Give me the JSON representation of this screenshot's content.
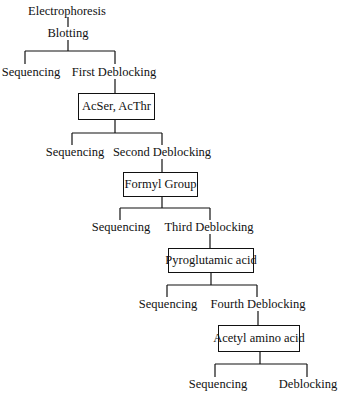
{
  "diagram": {
    "root": "Electrophoresis",
    "step": "Blotting",
    "levels": [
      {
        "left": "Sequencing",
        "right": "First Deblocking",
        "box": "AcSer, AcThr"
      },
      {
        "left": "Sequencing",
        "right": "Second Deblocking",
        "box": "Formyl Group"
      },
      {
        "left": "Sequencing",
        "right": "Third Deblocking",
        "box": "Pyroglutamic acid"
      },
      {
        "left": "Sequencing",
        "right": "Fourth Deblocking",
        "box": "Acetyl amino acid"
      }
    ],
    "final": {
      "left": "Sequencing",
      "right": "Deblocking"
    }
  }
}
